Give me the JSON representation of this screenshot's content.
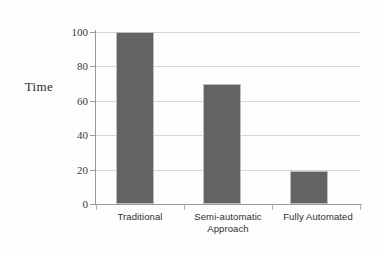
{
  "chart_data": {
    "type": "bar",
    "title": "",
    "xlabel": "",
    "ylabel": "Time",
    "categories": [
      "Traditional",
      "Semi-automatic Approach",
      "Fully Automated"
    ],
    "values": [
      100,
      70,
      19
    ],
    "ylim": [
      0,
      100
    ],
    "yticks": [
      0,
      20,
      40,
      60,
      80,
      100
    ],
    "ytick_labels": [
      "0",
      "20",
      "40",
      "60",
      "80",
      "100"
    ],
    "grid": true,
    "legend": false,
    "bar_color": "#636363",
    "grid_color": "#d5d5d5",
    "axis_color": "#9a9a9a",
    "background_color": "#fdfdfd"
  },
  "axis": {
    "y_title": "Time",
    "tick_labels": {
      "t0": "0",
      "t20": "20",
      "t40": "40",
      "t60": "60",
      "t80": "80",
      "t100": "100"
    }
  },
  "categories": {
    "c0_line1": "Traditional",
    "c0_line2": "",
    "c1_line1": "Semi-automatic",
    "c1_line2": "Approach",
    "c2_line1": "Fully Automated",
    "c2_line2": ""
  }
}
